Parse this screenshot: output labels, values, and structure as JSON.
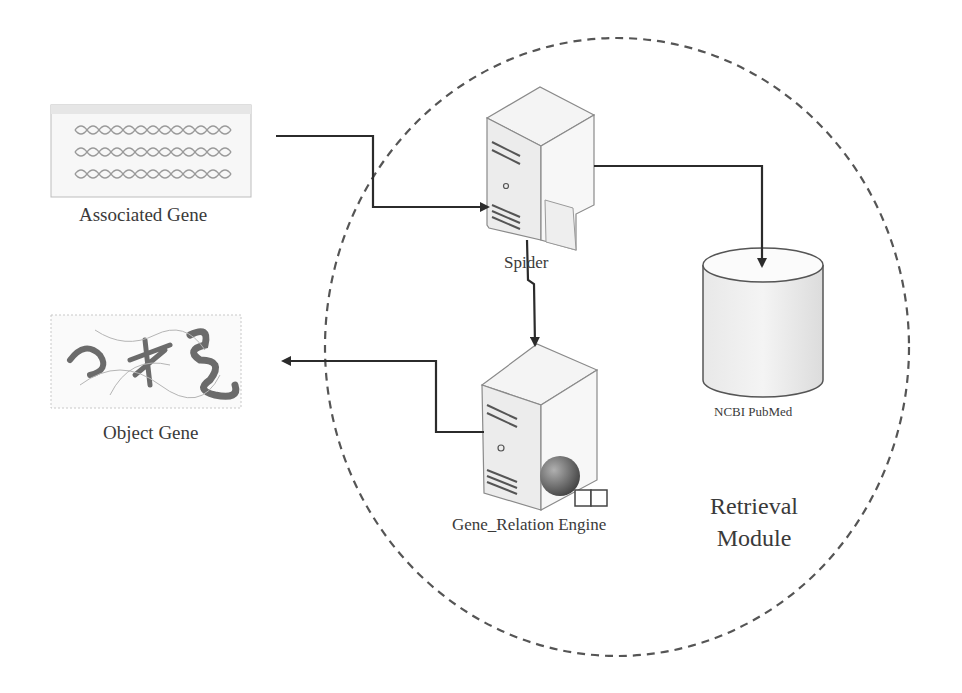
{
  "diagram": {
    "title": "Retrieval Module",
    "module_boundary": {
      "label_line1": "Retrieval",
      "label_line2": "Module",
      "style": "dashed-ellipse"
    },
    "nodes": [
      {
        "id": "associated_gene",
        "label": "Associated Gene",
        "icon": "dna-sequence-image"
      },
      {
        "id": "object_gene",
        "label": "Object Gene",
        "icon": "protein-structure-image"
      },
      {
        "id": "spider",
        "label": "Spider",
        "icon": "server-icon"
      },
      {
        "id": "gene_relation_engine",
        "label": "Gene_Relation Engine",
        "icon": "server-globe-icon"
      },
      {
        "id": "ncbi_pubmed",
        "label": "NCBI PubMed",
        "icon": "database-cylinder-icon"
      }
    ],
    "edges": [
      {
        "from": "associated_gene",
        "to": "spider"
      },
      {
        "from": "spider",
        "to": "ncbi_pubmed"
      },
      {
        "from": "spider",
        "to": "gene_relation_engine"
      },
      {
        "from": "gene_relation_engine",
        "to": "object_gene"
      }
    ],
    "colors": {
      "line": "#2b2b2b",
      "dashed_boundary": "#555555",
      "server_fill": "#f2f2f2",
      "server_stroke": "#8a8a8a",
      "text": "#3a3a3a"
    }
  }
}
